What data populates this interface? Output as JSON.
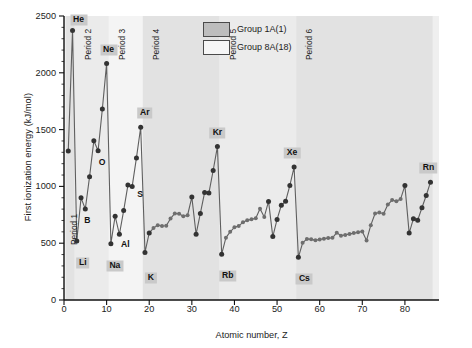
{
  "chart_data": {
    "type": "line",
    "title": "",
    "xlabel": "Atomic number, Z",
    "ylabel": "First ionization energy (kJ/mol)",
    "xlim": [
      0,
      88
    ],
    "ylim": [
      0,
      2500
    ],
    "xticks": [
      0,
      10,
      20,
      30,
      40,
      50,
      60,
      70,
      80
    ],
    "yticks": [
      0,
      500,
      1000,
      1500,
      2000,
      2500
    ],
    "yminor_step": 100,
    "grid": false,
    "marker": "filled circle",
    "line_color": "#5a5a5a",
    "marker_color": "#3a3a3a",
    "x": [
      1,
      2,
      3,
      4,
      5,
      6,
      7,
      8,
      9,
      10,
      11,
      12,
      13,
      14,
      15,
      16,
      17,
      18,
      19,
      20,
      21,
      22,
      23,
      24,
      25,
      26,
      27,
      28,
      29,
      30,
      31,
      32,
      33,
      34,
      35,
      36,
      37,
      38,
      39,
      40,
      41,
      42,
      43,
      44,
      45,
      46,
      47,
      48,
      49,
      50,
      51,
      52,
      53,
      54,
      55,
      56,
      57,
      58,
      59,
      60,
      61,
      62,
      63,
      64,
      65,
      66,
      67,
      68,
      69,
      70,
      71,
      72,
      73,
      74,
      75,
      76,
      77,
      78,
      79,
      80,
      81,
      82,
      83,
      84,
      85,
      86
    ],
    "y": [
      1312,
      2372,
      520,
      899,
      801,
      1086,
      1402,
      1314,
      1681,
      2081,
      496,
      738,
      578,
      787,
      1012,
      1000,
      1251,
      1521,
      419,
      590,
      633,
      659,
      651,
      653,
      717,
      762,
      760,
      737,
      746,
      906,
      579,
      762,
      947,
      941,
      1140,
      1351,
      403,
      549,
      600,
      640,
      652,
      684,
      702,
      710,
      720,
      804,
      731,
      868,
      558,
      709,
      834,
      869,
      1008,
      1170,
      376,
      503,
      538,
      534,
      527,
      533,
      540,
      545,
      547,
      593,
      566,
      573,
      581,
      589,
      597,
      603,
      524,
      659,
      761,
      770,
      760,
      840,
      880,
      870,
      890,
      1007,
      589,
      716,
      703,
      812,
      920,
      1037
    ],
    "series_label": "First ionization energy",
    "legend": {
      "position": "top-center",
      "items": [
        {
          "label": "Group 1A(1)",
          "swatch": "filled",
          "color": "#bdbdbd"
        },
        {
          "label": "Group 8A(18)",
          "swatch": "open",
          "color": "#f6f6f6"
        }
      ]
    },
    "period_bands": [
      {
        "label": "Period 1",
        "z_start": 1,
        "z_end": 2,
        "shade": "dark"
      },
      {
        "label": "Period 2",
        "z_start": 3,
        "z_end": 10,
        "shade": "light"
      },
      {
        "label": "Period 3",
        "z_start": 11,
        "z_end": 18,
        "shade": "lighter"
      },
      {
        "label": "Period 4",
        "z_start": 19,
        "z_end": 36,
        "shade": "dark"
      },
      {
        "label": "Period 5",
        "z_start": 37,
        "z_end": 54,
        "shade": "light"
      },
      {
        "label": "Period 6",
        "z_start": 55,
        "z_end": 86,
        "shade": "dark"
      }
    ],
    "annotations": [
      {
        "text": "He",
        "z": 2,
        "value": 2372,
        "boxed": true
      },
      {
        "text": "Ne",
        "z": 10,
        "value": 2081,
        "boxed": true
      },
      {
        "text": "Ar",
        "z": 18,
        "value": 1521,
        "boxed": true
      },
      {
        "text": "Kr",
        "z": 36,
        "value": 1351,
        "boxed": true
      },
      {
        "text": "Xe",
        "z": 54,
        "value": 1170,
        "boxed": true
      },
      {
        "text": "Rn",
        "z": 86,
        "value": 1037,
        "boxed": true
      },
      {
        "text": "Li",
        "z": 3,
        "value": 520,
        "boxed": true
      },
      {
        "text": "Na",
        "z": 11,
        "value": 496,
        "boxed": true
      },
      {
        "text": "K",
        "z": 19,
        "value": 419,
        "boxed": true
      },
      {
        "text": "Rb",
        "z": 37,
        "value": 403,
        "boxed": true
      },
      {
        "text": "Cs",
        "z": 55,
        "value": 376,
        "boxed": true
      },
      {
        "text": "B",
        "z": 5,
        "value": 801,
        "boxed": false
      },
      {
        "text": "O",
        "z": 8,
        "value": 1314,
        "boxed": false
      },
      {
        "text": "Al",
        "z": 13,
        "value": 578,
        "boxed": false
      },
      {
        "text": "S",
        "z": 16,
        "value": 1000,
        "boxed": false
      }
    ]
  },
  "axes": {
    "y_title": "First ionization energy (kJ/mol)",
    "x_title": "Atomic number, Z",
    "y_tick_labels": [
      "0",
      "500",
      "1000",
      "1500",
      "2000",
      "2500"
    ],
    "x_tick_labels": [
      "0",
      "10",
      "20",
      "30",
      "40",
      "50",
      "60",
      "70",
      "80"
    ]
  },
  "legend": {
    "item1": "Group 1A(1)",
    "item2": "Group 8A(18)"
  },
  "periods": {
    "p1": "Period 1",
    "p2": "Period 2",
    "p3": "Period 3",
    "p4": "Period 4",
    "p5": "Period 5",
    "p6": "Period 6"
  },
  "elements": {
    "he": "He",
    "ne": "Ne",
    "ar": "Ar",
    "kr": "Kr",
    "xe": "Xe",
    "rn": "Rn",
    "li": "Li",
    "na": "Na",
    "k": "K",
    "rb": "Rb",
    "cs": "Cs",
    "b": "B",
    "o": "O",
    "al": "Al",
    "s": "S"
  },
  "colors": {
    "band_dark": "#e2e2e2",
    "band_light": "#ebebeb",
    "band_lighter": "#f4f4f4",
    "plot_bg": "#efefef",
    "line": "#5f5f5f",
    "marker": "#333333",
    "axis": "#111111",
    "label_box": "#c9c9c9"
  }
}
